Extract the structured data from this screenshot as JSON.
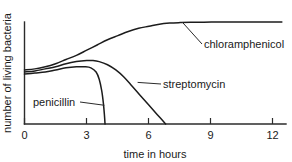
{
  "chart_data": {
    "type": "line",
    "title": "",
    "subtitle": "",
    "xlabel": "time in hours",
    "ylabel": "number of living bacteria",
    "xlim": [
      0,
      12.6
    ],
    "ylim": [
      0,
      100
    ],
    "grid": false,
    "legend_position": "inline-annotations",
    "xticks": [
      0,
      3,
      6,
      9,
      12
    ],
    "xtick_labels": [
      "0",
      "3",
      "6",
      "9",
      "12"
    ],
    "yticks": [],
    "ytick_labels": [],
    "series": [
      {
        "name": "chloramphenicol",
        "label": "chloramphenicol",
        "x": [
          0,
          0.5,
          1,
          1.5,
          2,
          2.5,
          3,
          3.5,
          4,
          4.5,
          5,
          5.5,
          6,
          6.5,
          7,
          7.5,
          8,
          9,
          10,
          11,
          12,
          12.4
        ],
        "values": [
          52,
          53,
          55,
          58,
          62,
          66,
          71,
          76,
          81,
          85,
          89,
          92,
          94,
          96,
          97,
          97.5,
          97.8,
          98,
          98,
          98,
          98,
          98
        ]
      },
      {
        "name": "streptomycin",
        "label": "streptomycin",
        "x": [
          0,
          0.5,
          1,
          1.5,
          2,
          2.5,
          3,
          3.3,
          3.6,
          4,
          4.4,
          4.8,
          5.2,
          5.6,
          6,
          6.4,
          6.8
        ],
        "values": [
          50,
          51,
          53,
          55,
          58,
          60,
          61,
          61,
          60,
          57,
          52,
          45,
          36,
          27,
          18,
          9,
          0
        ]
      },
      {
        "name": "penicillin",
        "label": "penicillin",
        "x": [
          0,
          0.5,
          1,
          1.5,
          2,
          2.5,
          2.9,
          3.2,
          3.45,
          3.6,
          3.72,
          3.8,
          3.85,
          3.88
        ],
        "values": [
          48,
          49,
          50,
          52,
          54,
          55,
          55,
          54,
          50,
          43,
          32,
          20,
          9,
          0
        ]
      }
    ],
    "annotations": [
      {
        "text": "chloramphenicol",
        "series": "chloramphenicol",
        "leader_from_x": 7.6,
        "leader_from_y": 98
      },
      {
        "text": "streptomycin",
        "series": "streptomycin",
        "leader_from_x": 5.45,
        "leader_from_y": 40
      },
      {
        "text": "penicillin",
        "series": "penicillin",
        "leader_from_x": 3.85,
        "leader_from_y": 18
      }
    ]
  },
  "axes": {
    "x_axis_title": "time in hours",
    "y_axis_title": "number of living bacteria",
    "tick_0": "0",
    "tick_3": "3",
    "tick_6": "6",
    "tick_9": "9",
    "tick_12": "12"
  },
  "labels": {
    "chloramphenicol": "chloramphenicol",
    "streptomycin": "streptomycin",
    "penicillin": "penicillin"
  },
  "colors": {
    "background": "#ffffff",
    "axis": "#2b2b2b",
    "curve": "#1c1c1c",
    "text": "#1a1a1a"
  }
}
